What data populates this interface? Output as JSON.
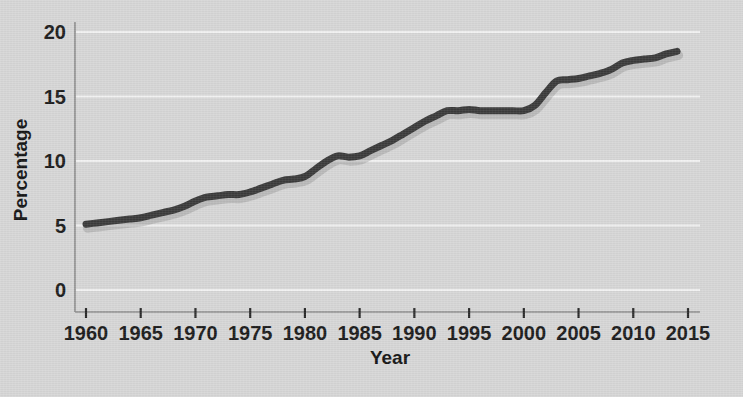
{
  "chart_data": {
    "type": "line",
    "title": "",
    "xlabel": "Year",
    "ylabel": "Percentage",
    "xlim": [
      1958,
      2016
    ],
    "ylim": [
      0,
      21
    ],
    "grid": true,
    "legend": "none",
    "x_ticks": [
      1960,
      1965,
      1970,
      1975,
      1980,
      1985,
      1990,
      1995,
      2000,
      2005,
      2010,
      2015
    ],
    "x_tick_labels": [
      "1960",
      "1965",
      "1970",
      "1975",
      "1980",
      "1985",
      "1990",
      "1995",
      "2000",
      "2005",
      "2010",
      "2015"
    ],
    "y_ticks": [
      0,
      5,
      10,
      15,
      20
    ],
    "y_tick_labels": [
      "0",
      "5",
      "10",
      "15",
      "20"
    ],
    "line_color": "#3b3b3b",
    "background_color": "#d7d7d7",
    "gridline_color": "#f2f2f2",
    "series": [
      {
        "name": "Percentage",
        "x": [
          1960,
          1961,
          1962,
          1963,
          1964,
          1965,
          1966,
          1967,
          1968,
          1969,
          1970,
          1971,
          1972,
          1973,
          1974,
          1975,
          1976,
          1977,
          1978,
          1979,
          1980,
          1981,
          1982,
          1983,
          1984,
          1985,
          1986,
          1987,
          1988,
          1989,
          1990,
          1991,
          1992,
          1993,
          1994,
          1995,
          1996,
          1997,
          1998,
          1999,
          2000,
          2001,
          2002,
          2003,
          2004,
          2005,
          2006,
          2007,
          2008,
          2009,
          2010,
          2011,
          2012,
          2013,
          2014
        ],
        "values": [
          5.1,
          5.2,
          5.3,
          5.4,
          5.5,
          5.6,
          5.8,
          6.0,
          6.2,
          6.5,
          6.9,
          7.2,
          7.3,
          7.4,
          7.4,
          7.6,
          7.9,
          8.2,
          8.5,
          8.6,
          8.8,
          9.4,
          10.0,
          10.4,
          10.3,
          10.4,
          10.8,
          11.2,
          11.6,
          12.1,
          12.6,
          13.1,
          13.5,
          13.9,
          13.9,
          14.0,
          13.9,
          13.9,
          13.9,
          13.9,
          13.9,
          14.3,
          15.3,
          16.2,
          16.3,
          16.4,
          16.6,
          16.8,
          17.1,
          17.6,
          17.8,
          17.9,
          18.0,
          18.3,
          18.5
        ]
      }
    ]
  },
  "axes": {
    "y_axis_label": "Percentage",
    "x_axis_label": "Year"
  }
}
